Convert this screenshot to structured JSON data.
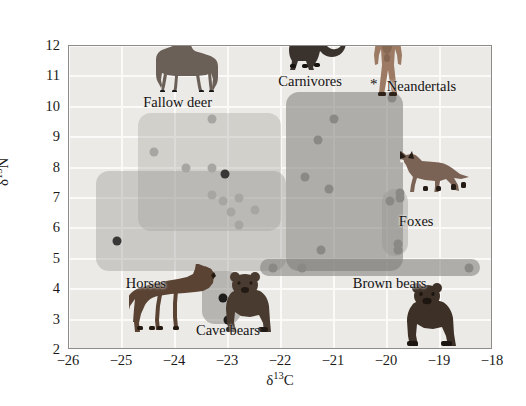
{
  "figure": {
    "background_color": "#ffffff",
    "plot_background_color": "#eceae6",
    "frame_color": "#8e8c88"
  },
  "chart_data": {
    "type": "scatter",
    "title": "",
    "xlabel": "δ¹³C",
    "ylabel": "δ¹⁵N",
    "xlim": [
      -26,
      -18
    ],
    "ylim": [
      2,
      12
    ],
    "xticks": [
      "−26",
      "−25",
      "−24",
      "−23",
      "−22",
      "−21",
      "−20",
      "−19",
      "−18"
    ],
    "xtick_values": [
      -26,
      -25,
      -24,
      -23,
      -22,
      -21,
      -20,
      -19,
      -18
    ],
    "yticks": [
      "2",
      "3",
      "4",
      "5",
      "6",
      "7",
      "8",
      "9",
      "10",
      "11",
      "12"
    ],
    "ytick_values": [
      2,
      3,
      4,
      5,
      6,
      7,
      8,
      9,
      10,
      11,
      12
    ],
    "grid": true,
    "grid_color": "#fbfaf8",
    "legend_position": "in-plot-annotations",
    "series": [
      {
        "name": "Fallow deer",
        "marker_color": "#a8a6a2",
        "points": [
          {
            "x": -23.3,
            "y": 9.6
          },
          {
            "x": -24.4,
            "y": 8.5
          },
          {
            "x": -23.8,
            "y": 8.0
          },
          {
            "x": -23.3,
            "y": 8.0
          },
          {
            "x": -23.3,
            "y": 7.1
          },
          {
            "x": -23.1,
            "y": 6.9
          },
          {
            "x": -22.8,
            "y": 7.0
          },
          {
            "x": -22.95,
            "y": 6.55
          },
          {
            "x": -22.5,
            "y": 6.6
          },
          {
            "x": -22.8,
            "y": 6.1
          }
        ]
      },
      {
        "name": "Horses",
        "marker_color": "#3a3836",
        "points": [
          {
            "x": -25.1,
            "y": 5.6
          },
          {
            "x": -23.05,
            "y": 7.8
          }
        ]
      },
      {
        "name": "Carnivores",
        "marker_color": "#8b8986",
        "points": [
          {
            "x": -21.0,
            "y": 9.6
          },
          {
            "x": -21.3,
            "y": 8.9
          },
          {
            "x": -21.55,
            "y": 7.7
          },
          {
            "x": -21.1,
            "y": 7.3
          },
          {
            "x": -21.25,
            "y": 5.3
          },
          {
            "x": -21.6,
            "y": 4.7
          },
          {
            "x": -22.15,
            "y": 4.7
          }
        ]
      },
      {
        "name": "Neandertals",
        "marker_color": "#8b8986",
        "points": [
          {
            "x": -19.9,
            "y": 10.3
          }
        ]
      },
      {
        "name": "Foxes",
        "marker_color": "#8b8986",
        "points": [
          {
            "x": -19.95,
            "y": 6.9
          },
          {
            "x": -19.75,
            "y": 7.0
          },
          {
            "x": -19.75,
            "y": 7.15
          },
          {
            "x": -19.8,
            "y": 5.5
          },
          {
            "x": -19.8,
            "y": 5.3
          }
        ]
      },
      {
        "name": "Brown bears",
        "marker_color": "#8b8986",
        "points": [
          {
            "x": -18.45,
            "y": 4.7
          }
        ]
      },
      {
        "name": "Cave bears",
        "marker_color": "#1f1d1c",
        "points": [
          {
            "x": -23.35,
            "y": 4.4
          },
          {
            "x": -23.1,
            "y": 3.7
          },
          {
            "x": -22.9,
            "y": 3.4
          },
          {
            "x": -23.0,
            "y": 3.0
          }
        ]
      }
    ],
    "clusters": [
      {
        "name": "fallow-deer-cluster",
        "x0": -24.7,
        "x1": -22.0,
        "y0": 5.9,
        "y1": 9.8,
        "color": "rgba(150,148,144,0.30)"
      },
      {
        "name": "horses-cluster",
        "x0": -25.5,
        "x1": -21.9,
        "y0": 4.6,
        "y1": 7.9,
        "color": "rgba(150,148,144,0.38)"
      },
      {
        "name": "carnivores-cluster",
        "x0": -21.9,
        "x1": -19.7,
        "y0": 4.6,
        "y1": 10.5,
        "color": "rgba(124,122,118,0.55)"
      },
      {
        "name": "brown-bears-cluster",
        "x0": -22.4,
        "x1": -18.25,
        "y0": 4.45,
        "y1": 5.0,
        "color": "rgba(124,122,118,0.55)"
      },
      {
        "name": "foxes-cluster",
        "x0": -20.1,
        "x1": -19.6,
        "y0": 5.1,
        "y1": 7.3,
        "color": "rgba(150,148,144,0.40)"
      },
      {
        "name": "cave-bears-cluster",
        "x0": -23.5,
        "x1": -22.75,
        "y0": 2.85,
        "y1": 4.6,
        "color": "rgba(130,128,124,0.50)"
      }
    ],
    "annotations": [
      {
        "label": "Fallow deer",
        "x": -23.95,
        "y": 10.15
      },
      {
        "label": "Carnivores",
        "x": -21.45,
        "y": 10.85
      },
      {
        "label": "Neandertals",
        "x": -19.35,
        "y": 10.7
      },
      {
        "label": "Foxes",
        "x": -19.45,
        "y": 6.25
      },
      {
        "label": "Brown bears",
        "x": -19.95,
        "y": 4.2
      },
      {
        "label": "Horses",
        "x": -24.55,
        "y": 4.2
      },
      {
        "label": "Cave bears",
        "x": -23.0,
        "y": 2.65
      }
    ],
    "markers": [
      {
        "label": "*",
        "name": "asterisk-marker",
        "x": -20.25,
        "y": 10.75
      }
    ],
    "illustrations": [
      {
        "name": "fallow-deer-illustration",
        "x": -23.9,
        "y": 10.5
      },
      {
        "name": "carnivore-cat-illustration",
        "x": -21.35,
        "y": 11.2
      },
      {
        "name": "neandertal-human-illustration",
        "x": -20.0,
        "y": 10.35
      },
      {
        "name": "fox-illustration",
        "x": -19.1,
        "y": 7.2
      },
      {
        "name": "horse-illustration",
        "x": -24.0,
        "y": 2.6
      },
      {
        "name": "cave-bear-illustration",
        "x": -22.6,
        "y": 2.55
      },
      {
        "name": "brown-bear-illustration",
        "x": -19.15,
        "y": 2.1
      }
    ]
  }
}
